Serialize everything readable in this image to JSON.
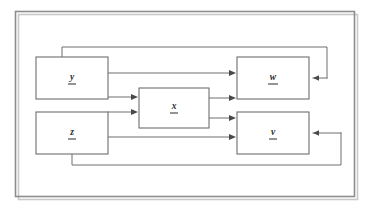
{
  "diagram": {
    "frame": {
      "label": "outer-border"
    },
    "nodes": [
      {
        "id": "y_in",
        "label": "y",
        "underlined": true,
        "x": 36,
        "y": 57,
        "w": 72,
        "h": 42
      },
      {
        "id": "z_in",
        "label": "z",
        "underlined": true,
        "x": 36,
        "y": 112,
        "w": 72,
        "h": 42
      },
      {
        "id": "x_mid",
        "label": "x",
        "underlined": true,
        "x": 139,
        "y": 88,
        "w": 70,
        "h": 40
      },
      {
        "id": "w_out",
        "label": "w",
        "underlined": true,
        "x": 237,
        "y": 57,
        "w": 72,
        "h": 42
      },
      {
        "id": "v_out",
        "label": "v",
        "underlined": true,
        "x": 237,
        "y": 112,
        "w": 72,
        "h": 42
      }
    ],
    "edges": [
      {
        "id": "edge-y-to-w",
        "from": "y_in",
        "to": "w_out",
        "arrow": "right"
      },
      {
        "id": "edge-y-to-x",
        "from": "y_in",
        "to": "x_mid",
        "arrow": "right"
      },
      {
        "id": "edge-z-to-x",
        "from": "z_in",
        "to": "x_mid",
        "arrow": "right"
      },
      {
        "id": "edge-z-to-v",
        "from": "z_in",
        "to": "v_out",
        "arrow": "right"
      },
      {
        "id": "edge-x-to-w",
        "from": "x_mid",
        "to": "w_out",
        "arrow": "right"
      },
      {
        "id": "edge-x-to-v",
        "from": "x_mid",
        "to": "v_out",
        "arrow": "right"
      },
      {
        "id": "feedback-top",
        "from": "y_in",
        "to": "w_out",
        "arrow": "left"
      },
      {
        "id": "feedback-bottom",
        "from": "z_in",
        "to": "v_out",
        "arrow": "left"
      }
    ],
    "colors": {
      "background": "#ffffff",
      "border": "#8d8d8d",
      "node_stroke": "#6e6e6e",
      "edge_stroke": "#6e6e6e",
      "label": "#2b2b2b"
    }
  }
}
